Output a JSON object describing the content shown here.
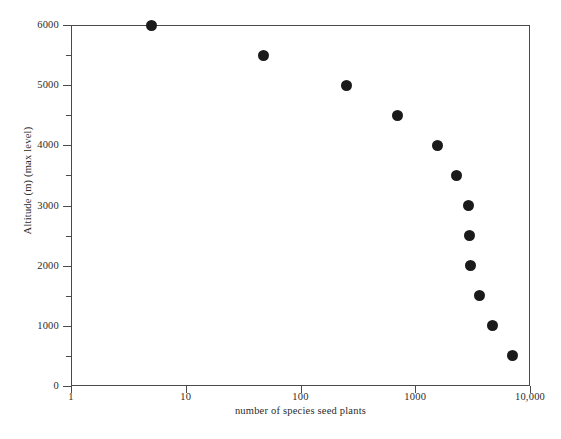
{
  "chart_data": {
    "type": "scatter",
    "title": "",
    "xlabel": "number of species seed plants",
    "ylabel": "Altitude (m) (max level)",
    "xscale": "log",
    "yscale": "linear",
    "xlim": [
      1,
      10000
    ],
    "ylim": [
      0,
      6000
    ],
    "grid": false,
    "legend": null,
    "x_tick_labels": [
      "1",
      "10",
      "100",
      "1000",
      "10,000"
    ],
    "x_tick_values": [
      1,
      10,
      100,
      1000,
      10000
    ],
    "y_tick_labels": [
      "0",
      "1000",
      "2000",
      "3000",
      "4000",
      "5000",
      "6000"
    ],
    "y_tick_values": [
      0,
      1000,
      2000,
      3000,
      4000,
      5000,
      6000
    ],
    "y_minor_tick_values": [
      500,
      1500,
      2500,
      3500,
      4500,
      5500
    ],
    "marker": {
      "shape": "circle",
      "color": "#1a1a1a",
      "size_px": 11
    },
    "series": [
      {
        "name": "seed plant species by max altitude",
        "points": [
          {
            "x": 5,
            "y": 6000
          },
          {
            "x": 48,
            "y": 5500
          },
          {
            "x": 250,
            "y": 5000
          },
          {
            "x": 700,
            "y": 4500
          },
          {
            "x": 1550,
            "y": 4000
          },
          {
            "x": 2280,
            "y": 3500
          },
          {
            "x": 2900,
            "y": 3000
          },
          {
            "x": 2980,
            "y": 2500
          },
          {
            "x": 3050,
            "y": 2000
          },
          {
            "x": 3600,
            "y": 1500
          },
          {
            "x": 4700,
            "y": 1000
          },
          {
            "x": 7000,
            "y": 500
          }
        ]
      }
    ],
    "colors": {
      "background": "#ffffff",
      "axis": "#4a4a4a",
      "text": "#2b2b2b",
      "marker": "#1a1a1a"
    }
  }
}
